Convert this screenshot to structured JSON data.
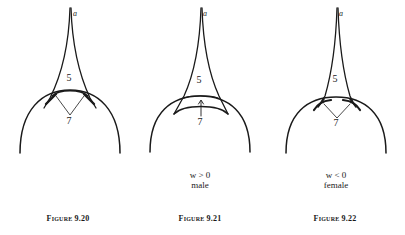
{
  "figures": [
    {
      "id": "fig-9-20",
      "caption": "Figure 9.20",
      "top_label": "a",
      "region_upper_label": "5",
      "region_lower_label": "7",
      "condition": "",
      "sex": ""
    },
    {
      "id": "fig-9-21",
      "caption": "Figure 9.21",
      "top_label": "a",
      "region_upper_label": "5",
      "region_lower_label": "7",
      "condition": "w > 0",
      "sex": "male"
    },
    {
      "id": "fig-9-22",
      "caption": "Figure 9.22",
      "top_label": "a",
      "region_upper_label": "5",
      "region_lower_label": "7",
      "condition": "w < 0",
      "sex": "female"
    }
  ],
  "colors": {
    "ink": "#1a1a1a",
    "background": "#ffffff"
  }
}
